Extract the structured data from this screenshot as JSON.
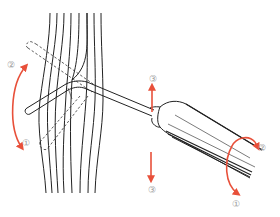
{
  "diagram": {
    "accent_color": "#e8503a",
    "line_color": "#222222",
    "labels": {
      "rotate_tip_up": "②",
      "rotate_tip_down": "①",
      "move_up": "③",
      "move_down": "③",
      "handle_rotate_top": "②",
      "handle_rotate_bottom": "①"
    },
    "components": [
      "fiber-bundle",
      "bent-probe-tip",
      "dashed-alternate-tip-position",
      "probe-shaft",
      "cylindrical-handle",
      "direction-arrows"
    ]
  }
}
